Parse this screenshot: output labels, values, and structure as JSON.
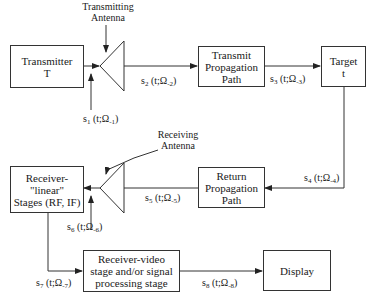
{
  "diagram": {
    "type": "radar signal flow block diagram",
    "blocks": {
      "transmitter": {
        "line1": "Transmitter",
        "line2": "T"
      },
      "transmit_path": {
        "line1": "Transmit",
        "line2": "Propagation",
        "line3": "Path"
      },
      "target": {
        "line1": "Target",
        "line2": "t"
      },
      "return_path": {
        "line1": "Return",
        "line2": "Propagation",
        "line3": "Path"
      },
      "receiver_linear": {
        "line1": "Receiver-",
        "line2": "\"linear\"",
        "line3": "Stages (RF, IF)"
      },
      "receiver_video": {
        "line1": "Receiver-video",
        "line2": "stage and/or signal",
        "line3": "processing stage"
      },
      "display": {
        "line1": "Display"
      }
    },
    "antennas": {
      "transmitting": {
        "line1": "Transmitting",
        "line2": "Antenna"
      },
      "receiving": {
        "line1": "Receiving",
        "line2": "Antenna"
      }
    },
    "signals": [
      {
        "base": "s",
        "sub": "1",
        "args": " (t;Ω",
        "argsub": "-1",
        "close": ")"
      },
      {
        "base": "s",
        "sub": "2",
        "args": " (t;Ω",
        "argsub": "-2",
        "close": ")"
      },
      {
        "base": "s",
        "sub": "3",
        "args": " (t;Ω",
        "argsub": "-3",
        "close": ")"
      },
      {
        "base": "s",
        "sub": "4",
        "args": " (t;Ω",
        "argsub": "-4",
        "close": ")"
      },
      {
        "base": "s",
        "sub": "5",
        "args": " (t;Ω",
        "argsub": "-5",
        "close": ")"
      },
      {
        "base": "s",
        "sub": "6",
        "args": " (t;Ω",
        "argsub": "-6",
        "close": ")"
      },
      {
        "base": "s",
        "sub": "7",
        "args": " (t;Ω",
        "argsub": "-7",
        "close": ")"
      },
      {
        "base": "s",
        "sub": "8",
        "args": " (t;Ω",
        "argsub": "-8",
        "close": ")"
      }
    ],
    "colors": {
      "line": "#333333",
      "text": "#1a1a1a",
      "background": "#ffffff"
    }
  }
}
